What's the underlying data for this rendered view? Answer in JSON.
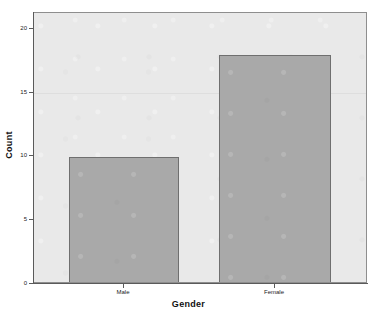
{
  "chart_data": {
    "type": "bar",
    "title": "",
    "subtitle": "",
    "categories": [
      "Male",
      "Female"
    ],
    "values": [
      10,
      18
    ],
    "xlabel": "Gender",
    "ylabel": "Count",
    "ylim": [
      0,
      21
    ],
    "yticks": [
      0,
      5,
      10,
      15,
      20
    ],
    "ytick_labels": [
      "0",
      "5",
      "10",
      "15",
      "20"
    ],
    "grid": true,
    "gridlines_at": [
      15
    ],
    "legend": null,
    "legend_position": "none",
    "annotations": [],
    "colors": {
      "bar_fill": "#a9a9a9",
      "bar_border": "#6f6f6f",
      "panel_background": "#e9e9e9",
      "panel_border": "#8e8e8e",
      "axis_line": "#5a5a5a",
      "gridline": "#dedede",
      "text": "#1a1a1a",
      "figure_background": "#ffffff"
    }
  },
  "axes": {
    "y": {
      "title": "Count",
      "ticks": [
        {
          "label": "20",
          "value": 20
        },
        {
          "label": "15",
          "value": 15
        },
        {
          "label": "10",
          "value": 10
        },
        {
          "label": "5",
          "value": 5
        },
        {
          "label": "0",
          "value": 0
        }
      ]
    },
    "x": {
      "title": "Gender",
      "ticks": [
        {
          "label": "Male"
        },
        {
          "label": "Female"
        }
      ]
    }
  },
  "bars": [
    {
      "category": "Male",
      "value": 10
    },
    {
      "category": "Female",
      "value": 18
    }
  ]
}
